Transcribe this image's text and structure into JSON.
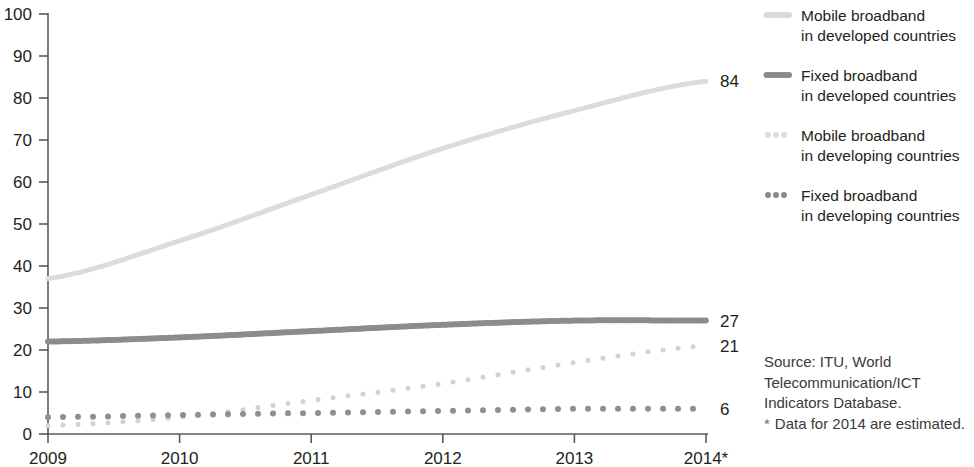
{
  "chart_data": {
    "type": "line",
    "title": "",
    "subtitle": "",
    "xlabel": "",
    "ylabel": "",
    "x": [
      "2009",
      "2010",
      "2011",
      "2012",
      "2013",
      "2014*"
    ],
    "categories": [
      "2009",
      "2010",
      "2011",
      "2012",
      "2013",
      "2014*"
    ],
    "xlim": [
      2009,
      2014
    ],
    "ylim": [
      0,
      100
    ],
    "y_ticks": [
      0,
      10,
      20,
      30,
      40,
      50,
      60,
      70,
      80,
      90,
      100
    ],
    "x_ticks": [
      "2009",
      "2010",
      "2011",
      "2012",
      "2013",
      "2014*"
    ],
    "grid": false,
    "legend_position": "right",
    "series": [
      {
        "name": "Mobile broadband in developed countries",
        "values": [
          37,
          46,
          57,
          68,
          77,
          84
        ],
        "end_label": "84",
        "color": "#dcdcdc",
        "style": "solid-beaded",
        "line_width": 5
      },
      {
        "name": "Fixed broadband in developed countries",
        "values": [
          22,
          23,
          24.5,
          26,
          27,
          27
        ],
        "end_label": "27",
        "color": "#8c8c8c",
        "style": "solid-beaded",
        "line_width": 6
      },
      {
        "name": "Mobile broadband in developing countries",
        "values": [
          2,
          4,
          8,
          12,
          17,
          21
        ],
        "end_label": "21",
        "color": "#d3d3d3",
        "style": "dotted",
        "line_width": 5
      },
      {
        "name": "Fixed broadband in developing countries",
        "values": [
          4,
          4.5,
          5,
          5.5,
          6,
          6
        ],
        "end_label": "6",
        "color": "#8f8f8f",
        "style": "dotted",
        "line_width": 6
      }
    ]
  },
  "axis": {
    "y_tick_labels": [
      "100",
      "90",
      "80",
      "70",
      "60",
      "50",
      "40",
      "30",
      "20",
      "10",
      "0"
    ],
    "x_tick_labels": [
      "2009",
      "2010",
      "2011",
      "2012",
      "2013",
      "2014*"
    ]
  },
  "end_labels": [
    {
      "value": "84",
      "series": "Mobile broadband in developed countries"
    },
    {
      "value": "27",
      "series": "Fixed broadband in developed countries"
    },
    {
      "value": "21",
      "series": "Mobile broadband in developing countries"
    },
    {
      "value": "6",
      "series": "Fixed broadband in developing countries"
    }
  ],
  "legend": {
    "items": [
      {
        "marker": "light-solid-line-marker",
        "line1": "Mobile broadband",
        "line2": "in developed countries",
        "color": "#d9d9d9",
        "style": "solid"
      },
      {
        "marker": "dark-solid-line-marker",
        "line1": "Fixed broadband",
        "line2": "in developed countries",
        "color": "#8a8a8a",
        "style": "solid"
      },
      {
        "marker": "light-dotted-line-marker",
        "line1": "Mobile broadband",
        "line2": "in developing countries",
        "color": "#dcdcdc",
        "style": "dotted"
      },
      {
        "marker": "dark-dotted-line-marker",
        "line1": "Fixed broadband",
        "line2": "in developing countries",
        "color": "#8a8a8a",
        "style": "dotted"
      }
    ]
  },
  "source_note": {
    "line1": "Source:  ITU, World",
    "line2": "Telecommunication/ICT",
    "line3": "Indicators Database.",
    "star_mark": "*",
    "line4": "Data for 2014 are estimated."
  },
  "colors": {
    "axis": "#5a5a5a",
    "text": "#231f20",
    "light_series": "#dcdcdc",
    "dark_series": "#8c8c8c",
    "background": "#ffffff"
  }
}
